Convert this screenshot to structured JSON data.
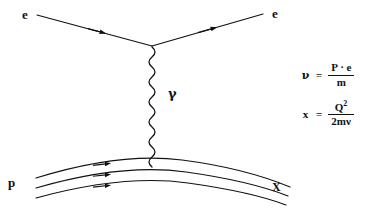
{
  "figure": {
    "kind": "feynman-diagram",
    "background_color": "#ffffff",
    "line_color": "#111111"
  },
  "labels": {
    "electron_in": "e",
    "electron_out": "e",
    "photon": "γ",
    "proton": "p",
    "hadronic_final_state": "X"
  },
  "equations": [
    {
      "id": "nu-definition",
      "lhs": "ν",
      "relation": "=",
      "numerator": "P · e",
      "denominator": "m"
    },
    {
      "id": "x-definition",
      "lhs": "x",
      "relation": "=",
      "numerator_base": "Q",
      "numerator_exponent": "2",
      "denominator": "2mν"
    }
  ]
}
